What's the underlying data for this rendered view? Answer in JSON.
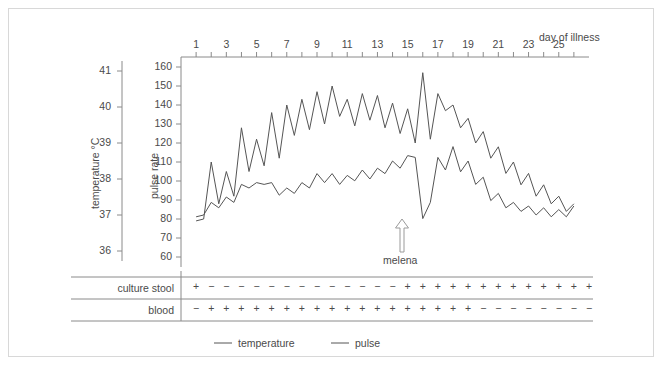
{
  "chart_data": {
    "type": "line",
    "title": "",
    "xlabel": "day of illness",
    "x_ticks": [
      1,
      3,
      5,
      7,
      9,
      11,
      13,
      15,
      17,
      19,
      21,
      23,
      25
    ],
    "x_minor_step": 1,
    "xlim": [
      0,
      27
    ],
    "grid": false,
    "legend_position": "bottom",
    "axes": [
      {
        "name": "temperature",
        "ylabel": "temperature °C",
        "ylim": [
          36,
          41
        ],
        "y_ticks": [
          36,
          37,
          38,
          39,
          40,
          41
        ],
        "side": "left-outer"
      },
      {
        "name": "pulse rate",
        "ylabel": "pulse rate",
        "ylim": [
          60,
          160
        ],
        "y_ticks": [
          60,
          70,
          80,
          90,
          100,
          110,
          120,
          130,
          140,
          150,
          160
        ],
        "side": "left-inner"
      }
    ],
    "x": [
      1,
      1.5,
      2,
      2.5,
      3,
      3.5,
      4,
      4.5,
      5,
      5.5,
      6,
      6.5,
      7,
      7.5,
      8,
      8.5,
      9,
      9.5,
      10,
      10.5,
      11,
      11.5,
      12,
      12.5,
      13,
      13.5,
      14,
      14.5,
      15,
      15.5,
      16,
      16.5,
      17,
      17.5,
      18,
      18.5,
      19,
      19.5,
      20,
      20.5,
      21,
      21.5,
      22,
      22.5,
      23,
      23.5,
      24,
      24.5,
      25,
      25.5,
      26
    ],
    "series": [
      {
        "name": "temperature",
        "unit": "°C",
        "axis": "temperature",
        "color": "#555555",
        "values": [
          36.95,
          37.0,
          37.35,
          37.2,
          37.5,
          37.35,
          37.85,
          37.75,
          37.9,
          37.85,
          37.9,
          37.55,
          37.75,
          37.6,
          37.9,
          37.75,
          38.15,
          37.9,
          38.15,
          37.85,
          38.1,
          37.95,
          38.25,
          38.0,
          38.3,
          38.15,
          38.5,
          38.3,
          38.65,
          38.6,
          36.9,
          37.35,
          38.6,
          38.25,
          38.9,
          38.2,
          38.5,
          37.85,
          38.05,
          37.4,
          37.6,
          37.2,
          37.35,
          37.1,
          37.25,
          37.0,
          37.2,
          36.95,
          37.15,
          36.95,
          37.25
        ]
      },
      {
        "name": "pulse",
        "unit": "bpm",
        "axis": "pulse rate",
        "color": "#555555",
        "values": [
          79,
          80,
          110,
          88,
          105,
          92,
          128,
          105,
          122,
          108,
          136,
          112,
          140,
          124,
          143,
          127,
          147,
          130,
          150,
          134,
          143,
          129,
          146,
          132,
          145,
          128,
          141,
          125,
          138,
          120,
          157,
          122,
          146,
          137,
          140,
          128,
          133,
          120,
          126,
          112,
          118,
          104,
          110,
          98,
          104,
          92,
          98,
          88,
          92,
          84,
          88
        ]
      }
    ],
    "annotations": [
      {
        "name": "melena",
        "label": "melena",
        "day": 16,
        "type": "arrow-up"
      }
    ],
    "legend": [
      {
        "label": "temperature",
        "color": "#555555"
      },
      {
        "label": "pulse",
        "color": "#555555"
      }
    ]
  },
  "top_axis": {
    "title": "day of illness",
    "ticks": [
      "1",
      "3",
      "5",
      "7",
      "9",
      "11",
      "13",
      "15",
      "17",
      "19",
      "21",
      "23",
      "25"
    ]
  },
  "y_axis_temperature": {
    "title": "temperature °C",
    "ticks": [
      "41",
      "40",
      "39",
      "38",
      "37",
      "36"
    ]
  },
  "y_axis_pulse": {
    "title": "pulse rate",
    "ticks": [
      "160",
      "150",
      "140",
      "130",
      "120",
      "110",
      "100",
      "90",
      "80",
      "70",
      "60"
    ]
  },
  "annotation": {
    "melena_label": "melena"
  },
  "table": {
    "rows": [
      {
        "label": "culture stool",
        "values": [
          "+",
          "−",
          "−",
          "−",
          "−",
          "−",
          "−",
          "−",
          "−",
          "−",
          "−",
          "−",
          "−",
          "−",
          "+",
          "+",
          "+",
          "+",
          "+",
          "+",
          "+",
          "+",
          "+",
          "+",
          "+",
          "+",
          "+"
        ]
      },
      {
        "label": "blood",
        "values": [
          "−",
          "+",
          "+",
          "+",
          "+",
          "+",
          "+",
          "+",
          "+",
          "+",
          "+",
          "+",
          "+",
          "+",
          "+",
          "+",
          "+",
          "+",
          "+",
          "−",
          "−",
          "−",
          "−",
          "−",
          "−",
          "−",
          "−"
        ]
      }
    ]
  },
  "legend": {
    "temperature_label": "temperature",
    "pulse_label": "pulse"
  },
  "colors": {
    "line": "#555555",
    "axis": "#8a8a8a",
    "border": "#d8d8d8",
    "text": "#4a4a4a"
  }
}
